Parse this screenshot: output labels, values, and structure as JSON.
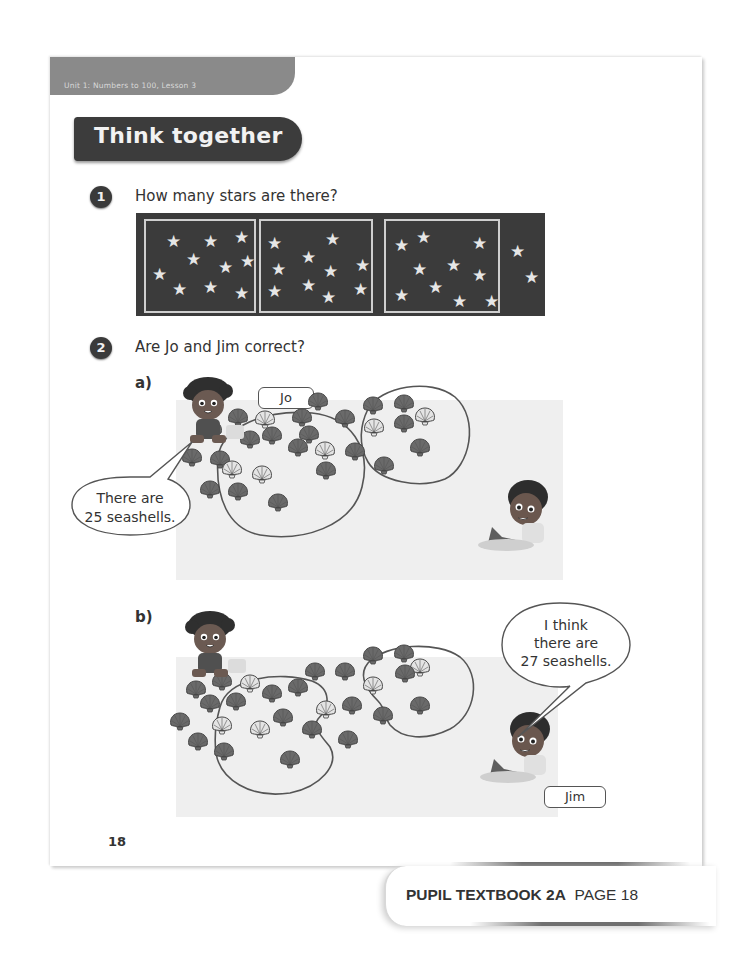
{
  "header": {
    "unit_label": "Unit 1: Numbers to 100, Lesson 3",
    "section_title": "Think together"
  },
  "questions": [
    {
      "number": "1",
      "text": "How many stars are there?"
    },
    {
      "number": "2",
      "text": "Are Jo and Jim correct?"
    }
  ],
  "star_panel": {
    "groups": [
      {
        "left": 8,
        "width": 108,
        "stars": [
          [
            20,
            12
          ],
          [
            57,
            12
          ],
          [
            88,
            8
          ],
          [
            40,
            30
          ],
          [
            72,
            38
          ],
          [
            94,
            32
          ],
          [
            6,
            45
          ],
          [
            26,
            60
          ],
          [
            57,
            58
          ],
          [
            88,
            64
          ]
        ]
      },
      {
        "left": 123,
        "width": 110,
        "stars": [
          [
            6,
            14
          ],
          [
            64,
            10
          ],
          [
            40,
            28
          ],
          [
            94,
            36
          ],
          [
            10,
            40
          ],
          [
            62,
            42
          ],
          [
            6,
            62
          ],
          [
            40,
            56
          ],
          [
            92,
            60
          ],
          [
            60,
            68
          ]
        ]
      },
      {
        "left": 248,
        "width": 112,
        "stars": [
          [
            8,
            16
          ],
          [
            30,
            8
          ],
          [
            86,
            14
          ],
          [
            26,
            40
          ],
          [
            60,
            36
          ],
          [
            86,
            46
          ],
          [
            8,
            66
          ],
          [
            42,
            58
          ],
          [
            66,
            72
          ],
          [
            98,
            72
          ]
        ]
      }
    ],
    "loose_stars": [
      [
        374,
        30
      ],
      [
        388,
        56
      ]
    ],
    "star_glyph": "★"
  },
  "part_a": {
    "label": "a)",
    "name_tag": "Jo",
    "speech": [
      "There are",
      "25 seashells."
    ],
    "shells_left_group": [
      [
        212,
        430,
        0
      ],
      [
        238,
        418,
        0
      ],
      [
        265,
        420,
        1
      ],
      [
        220,
        460,
        0
      ],
      [
        250,
        440,
        0
      ],
      [
        272,
        436,
        0
      ],
      [
        298,
        448,
        0
      ],
      [
        192,
        458,
        0
      ],
      [
        232,
        470,
        1
      ],
      [
        262,
        475,
        1
      ],
      [
        210,
        490,
        0
      ],
      [
        238,
        492,
        0
      ]
    ],
    "shells_right_group": [
      [
        373,
        406,
        0
      ],
      [
        404,
        404,
        0
      ],
      [
        425,
        417,
        1
      ],
      [
        345,
        419,
        0
      ],
      [
        374,
        428,
        1
      ],
      [
        404,
        424,
        0
      ],
      [
        325,
        451,
        1
      ],
      [
        355,
        452,
        0
      ],
      [
        420,
        448,
        0
      ],
      [
        384,
        466,
        0
      ]
    ],
    "shells_loose": [
      [
        302,
        418,
        0
      ],
      [
        318,
        402,
        0
      ],
      [
        309,
        435,
        0
      ],
      [
        326,
        471,
        0
      ],
      [
        278,
        503,
        0
      ]
    ]
  },
  "part_b": {
    "label": "b)",
    "name_tag": "Jim",
    "speech": [
      "I think",
      "there are",
      "27 seashells."
    ],
    "shells_left_group": [
      [
        196,
        690,
        0
      ],
      [
        222,
        682,
        0
      ],
      [
        250,
        684,
        1
      ],
      [
        210,
        704,
        0
      ],
      [
        236,
        702,
        0
      ],
      [
        180,
        722,
        0
      ],
      [
        222,
        726,
        1
      ],
      [
        260,
        730,
        1
      ],
      [
        198,
        742,
        0
      ],
      [
        224,
        752,
        0
      ]
    ],
    "shells_right_group": [
      [
        373,
        656,
        0
      ],
      [
        404,
        654,
        0
      ],
      [
        420,
        668,
        1
      ],
      [
        345,
        672,
        0
      ],
      [
        373,
        686,
        1
      ],
      [
        405,
        674,
        0
      ],
      [
        352,
        706,
        0
      ],
      [
        383,
        716,
        0
      ],
      [
        420,
        706,
        0
      ]
    ],
    "shells_loose": [
      [
        272,
        694,
        0
      ],
      [
        298,
        688,
        0
      ],
      [
        315,
        672,
        0
      ],
      [
        283,
        718,
        0
      ],
      [
        312,
        730,
        0
      ],
      [
        326,
        710,
        1
      ],
      [
        348,
        740,
        0
      ],
      [
        290,
        760,
        0
      ]
    ]
  },
  "page_number": "18",
  "footer": {
    "book": "PUPIL TEXTBOOK 2A",
    "page": "PAGE 18"
  },
  "colors": {
    "dark_panel": "#3b3b3b",
    "tab_grey": "#8a8a8a",
    "shell_dark": "#6a6a6a",
    "shell_light": "#e4e4e4",
    "sand": "#efefef"
  }
}
